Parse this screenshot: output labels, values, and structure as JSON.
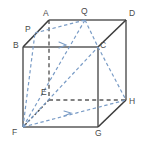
{
  "figure": {
    "type": "geometry-diagram",
    "width": 150,
    "height": 150,
    "background": "#ffffff",
    "solid_edge_color": "#5a5a5a",
    "hidden_edge_color": "#5a5a5a",
    "section_color": "#7a9cc6",
    "label_color": "#4a4a4a"
  },
  "vertices": [
    {
      "id": "A",
      "label": "A",
      "x": 49,
      "y": 20,
      "lx": 43,
      "ly": 9,
      "kind": "cube-vertex"
    },
    {
      "id": "B",
      "label": "B",
      "x": 23,
      "y": 47,
      "lx": 13,
      "ly": 41,
      "kind": "cube-vertex"
    },
    {
      "id": "C",
      "label": "C",
      "x": 98,
      "y": 47,
      "lx": 100,
      "ly": 41,
      "kind": "cube-vertex"
    },
    {
      "id": "D",
      "label": "D",
      "x": 126,
      "y": 20,
      "lx": 129,
      "ly": 9,
      "kind": "cube-vertex"
    },
    {
      "id": "E",
      "label": "E",
      "x": 49,
      "y": 100,
      "lx": 41,
      "ly": 88,
      "kind": "cube-vertex"
    },
    {
      "id": "F",
      "label": "F",
      "x": 23,
      "y": 127,
      "lx": 12,
      "ly": 128,
      "kind": "cube-vertex"
    },
    {
      "id": "G",
      "label": "G",
      "x": 98,
      "y": 127,
      "lx": 95,
      "ly": 129,
      "kind": "cube-vertex"
    },
    {
      "id": "H",
      "label": "H",
      "x": 126,
      "y": 100,
      "lx": 129,
      "ly": 97,
      "kind": "cube-vertex"
    },
    {
      "id": "P",
      "label": "P",
      "x": 35,
      "y": 33,
      "lx": 25,
      "ly": 25,
      "kind": "section-point"
    },
    {
      "id": "Q",
      "label": "Q",
      "x": 85,
      "y": 20,
      "lx": 81,
      "ly": 7,
      "kind": "section-point"
    }
  ],
  "edges_solid": [
    {
      "name": "edge-BC",
      "from": "B",
      "to": "C"
    },
    {
      "name": "edge-BF",
      "from": "B",
      "to": "F"
    },
    {
      "name": "edge-CG",
      "from": "C",
      "to": "G"
    },
    {
      "name": "edge-FG",
      "from": "F",
      "to": "G"
    },
    {
      "name": "edge-AD",
      "from": "A",
      "to": "D"
    },
    {
      "name": "edge-DH",
      "from": "D",
      "to": "H"
    },
    {
      "name": "edge-AB",
      "from": "A",
      "to": "B"
    },
    {
      "name": "edge-CD",
      "from": "C",
      "to": "D"
    },
    {
      "name": "edge-GH",
      "from": "G",
      "to": "H"
    }
  ],
  "edges_hidden": [
    {
      "name": "edge-AE",
      "from": "A",
      "to": "E"
    },
    {
      "name": "edge-EF",
      "from": "E",
      "to": "F"
    },
    {
      "name": "edge-EH",
      "from": "E",
      "to": "H"
    }
  ],
  "section_lines": [
    {
      "name": "section-PQ",
      "from": "P",
      "to": "Q"
    },
    {
      "name": "section-QC",
      "from": "Q",
      "to": "C"
    },
    {
      "name": "section-CH",
      "from": "C",
      "to": "H"
    },
    {
      "name": "section-FP",
      "from": "F",
      "to": "P"
    },
    {
      "name": "section-FQ",
      "from": "F",
      "to": "Q",
      "arrow": true
    },
    {
      "name": "section-FC",
      "from": "F",
      "to": "C"
    },
    {
      "name": "section-FH",
      "from": "F",
      "to": "H",
      "arrow": true
    }
  ]
}
